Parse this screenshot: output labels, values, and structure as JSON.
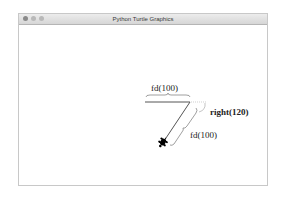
{
  "window": {
    "title": "Python Turtle Graphics",
    "controls": [
      "close",
      "minimize",
      "zoom"
    ]
  },
  "canvas": {
    "annotations": [
      {
        "id": "fd1",
        "text": "fd(100)"
      },
      {
        "id": "right",
        "text": "right(120)"
      },
      {
        "id": "fd2",
        "text": "fd(100)"
      }
    ],
    "stroke_color": "#555555",
    "turtle_color": "#000000",
    "turtle_icon": "turtle-icon"
  }
}
